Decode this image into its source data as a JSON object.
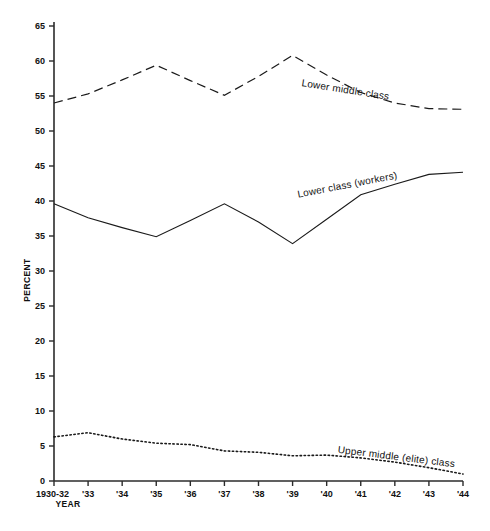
{
  "chart_data": {
    "type": "line",
    "title": "",
    "xlabel": "YEAR",
    "ylabel": "PERCENT",
    "x": [
      "1930-32",
      "'33",
      "'34",
      "'35",
      "'36",
      "'37",
      "'38",
      "'39",
      "'40",
      "'41",
      "'42",
      "'43",
      "'44"
    ],
    "xtick_labels": [
      "1930-32",
      "'33",
      "'34",
      "'35",
      "'36",
      "'37",
      "'38",
      "'39",
      "'40",
      "'41",
      "'42",
      "'43",
      "'44"
    ],
    "ytick_labels": [
      "0",
      "5",
      "10",
      "15",
      "20",
      "25",
      "30",
      "35",
      "40",
      "45",
      "50",
      "55",
      "60",
      "65"
    ],
    "ytick_values": [
      0,
      5,
      10,
      15,
      20,
      25,
      30,
      35,
      40,
      45,
      50,
      55,
      60,
      65
    ],
    "ylim": [
      0,
      65
    ],
    "grid": false,
    "legend_position": "inline-annotation",
    "series": [
      {
        "name": "Lower middle class",
        "style": "dashed",
        "label_text": "Lower middle class",
        "values": [
          54.0,
          55.3,
          57.3,
          59.4,
          57.2,
          55.1,
          57.8,
          60.8,
          58.0,
          55.5,
          54.0,
          53.2,
          53.1
        ]
      },
      {
        "name": "Lower class (workers)",
        "style": "solid",
        "label_text": "Lower class (workers)",
        "values": [
          39.6,
          37.6,
          36.2,
          34.9,
          37.2,
          39.6,
          37.0,
          33.9,
          37.4,
          40.9,
          42.4,
          43.8,
          44.1
        ]
      },
      {
        "name": "Upper middle (elite) class",
        "style": "dotted",
        "label_text": "Upper middle (elite) class",
        "values": [
          6.3,
          6.9,
          6.0,
          5.4,
          5.2,
          4.3,
          4.1,
          3.6,
          3.7,
          3.3,
          2.7,
          1.9,
          1.0
        ]
      }
    ],
    "colors": {
      "axis": "#2b2b2b",
      "line": "#1a1a1a",
      "background": "#ffffff"
    }
  }
}
